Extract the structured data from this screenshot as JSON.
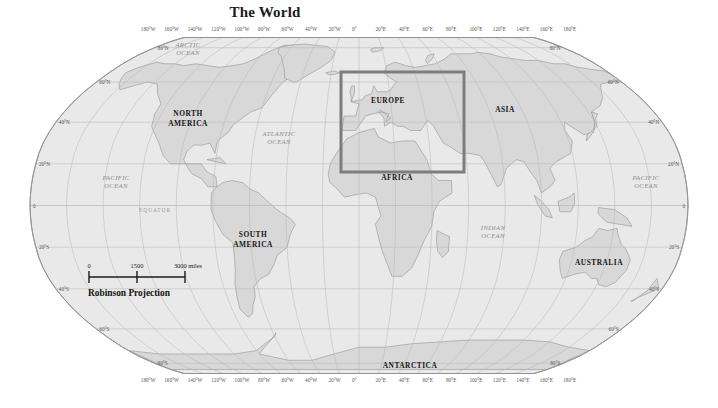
{
  "map": {
    "title": "The World",
    "projection_label": "Robinson Projection",
    "ocean_fill": "#e8e8e8",
    "land_fill": "#d8d8d8",
    "graticule_color": "#b9b9b9",
    "outline_color": "#9a9a9a",
    "selection_color": "#7d7d7d"
  },
  "scale_bar": {
    "zero": "0",
    "mid": "1500",
    "max": "3000 miles"
  },
  "longitude_labels_top": [
    "180°W",
    "160°W",
    "140°W",
    "120°W",
    "100°W",
    "80°W",
    "60°W",
    "40°W",
    "20°W",
    "0°",
    "20°E",
    "40°E",
    "60°E",
    "80°E",
    "100°E",
    "120°E",
    "140°E",
    "160°E",
    "180°E"
  ],
  "longitude_labels_bottom": [
    "180°W",
    "160°W",
    "140°W",
    "120°W",
    "100°W",
    "80°W",
    "60°W",
    "40°W",
    "20°W",
    "0°",
    "20°E",
    "40°E",
    "60°E",
    "80°E",
    "100°E",
    "120°E",
    "140°E",
    "160°E",
    "180°E"
  ],
  "latitude_labels_left": [
    "80°N",
    "60°N",
    "40°N",
    "20°N",
    "0",
    "20°S",
    "40°S",
    "60°S",
    "80°S"
  ],
  "latitude_labels_right": [
    "80°N",
    "60°N",
    "40°N",
    "20°N",
    "0",
    "20°S",
    "40°S",
    "60°S",
    "80°S"
  ],
  "continents": [
    {
      "name": "north-america",
      "line1": "NORTH",
      "line2": "AMERICA"
    },
    {
      "name": "south-america",
      "line1": "SOUTH",
      "line2": "AMERICA"
    },
    {
      "name": "europe",
      "line1": "EUROPE",
      "line2": ""
    },
    {
      "name": "africa",
      "line1": "AFRICA",
      "line2": ""
    },
    {
      "name": "asia",
      "line1": "ASIA",
      "line2": ""
    },
    {
      "name": "australia",
      "line1": "AUSTRALIA",
      "line2": ""
    },
    {
      "name": "antarctica",
      "line1": "ANTARCTICA",
      "line2": ""
    }
  ],
  "oceans": [
    {
      "name": "arctic-ocean",
      "line1": "ARCTIC",
      "line2": "OCEAN"
    },
    {
      "name": "atlantic-ocean",
      "line1": "ATLANTIC",
      "line2": "OCEAN"
    },
    {
      "name": "pacific-ocean-west",
      "line1": "PACIFIC",
      "line2": "OCEAN"
    },
    {
      "name": "pacific-ocean-east",
      "line1": "PACIFIC",
      "line2": "OCEAN"
    },
    {
      "name": "indian-ocean",
      "line1": "INDIAN",
      "line2": "OCEAN"
    }
  ],
  "equator_label": "EQUATOR",
  "selection": {
    "x": 341,
    "y": 72,
    "width": 123,
    "height": 100
  }
}
